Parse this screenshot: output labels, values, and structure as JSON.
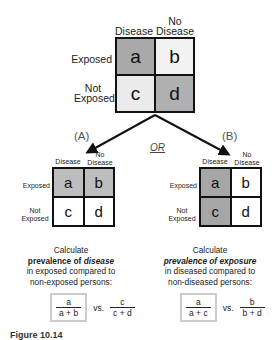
{
  "top_table": {
    "col_headers": [
      "Disease",
      "No\nDisease"
    ],
    "col_header_disease": "Disease",
    "col_header_no_line1": "No",
    "col_header_no_line2": "Disease",
    "row_header_exposed": "Exposed",
    "row_header_not_line1": "Not",
    "row_header_not_line2": "Exposed",
    "cells": [
      {
        "label": "a",
        "fill": "#a9a9a9"
      },
      {
        "label": "b",
        "fill": "#f2f2f2"
      },
      {
        "label": "c",
        "fill": "#ebebeb"
      },
      {
        "label": "d",
        "fill": "#b0b0b0"
      }
    ]
  },
  "connector": {
    "or_label": "OR"
  },
  "panel_a": {
    "label": "(A)",
    "col_header_disease": "Disease",
    "col_header_no_line1": "No",
    "col_header_no_line2": "Disease",
    "row_header_exposed": "Exposed",
    "row_header_not_line1": "Not",
    "row_header_not_line2": "Exposed",
    "cells": [
      {
        "label": "a",
        "fill": "#bdbdbd"
      },
      {
        "label": "b",
        "fill": "#bdbdbd"
      },
      {
        "label": "c",
        "fill": "#ffffff"
      },
      {
        "label": "d",
        "fill": "#ffffff"
      }
    ],
    "desc_line1": "Calculate",
    "desc_bold": "prevalence of ",
    "desc_bold_italic": "disease",
    "desc_line3": "in exposed compared to",
    "desc_line4": "non-exposed persons:",
    "formula": {
      "left_num": "a",
      "left_den": "a + b",
      "vs": "vs.",
      "right_num": "c",
      "right_den": "c + d"
    }
  },
  "panel_b": {
    "label": "(B)",
    "col_header_disease": "Disease",
    "col_header_no_line1": "No",
    "col_header_no_line2": "Disease",
    "row_header_exposed": "Exposed",
    "row_header_not_line1": "Not",
    "row_header_not_line2": "Exposed",
    "cells": [
      {
        "label": "a",
        "fill": "#a6a6a6"
      },
      {
        "label": "b",
        "fill": "#ffffff"
      },
      {
        "label": "c",
        "fill": "#a6a6a6"
      },
      {
        "label": "d",
        "fill": "#ffffff"
      }
    ],
    "desc_line1": "Calculate",
    "desc_bold_italic1": "prevalence of ",
    "desc_bold_italic2": "exposure",
    "desc_line3": "in diseased compared to",
    "desc_line4": "non-diseased persons:",
    "formula": {
      "left_num": "a",
      "left_den": "a + c",
      "vs": "vs.",
      "right_num": "b",
      "right_den": "b + d"
    }
  },
  "caption": {
    "figure_label": "Figure 10.14"
  }
}
